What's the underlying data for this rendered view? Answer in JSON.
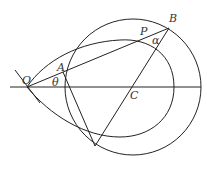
{
  "labels": {
    "O": "O",
    "A": "A",
    "P": "P",
    "B": "B",
    "C": "C",
    "theta": "θ",
    "alpha": "α"
  },
  "colors": {
    "stroke": "#222222",
    "text": "#333333"
  }
}
